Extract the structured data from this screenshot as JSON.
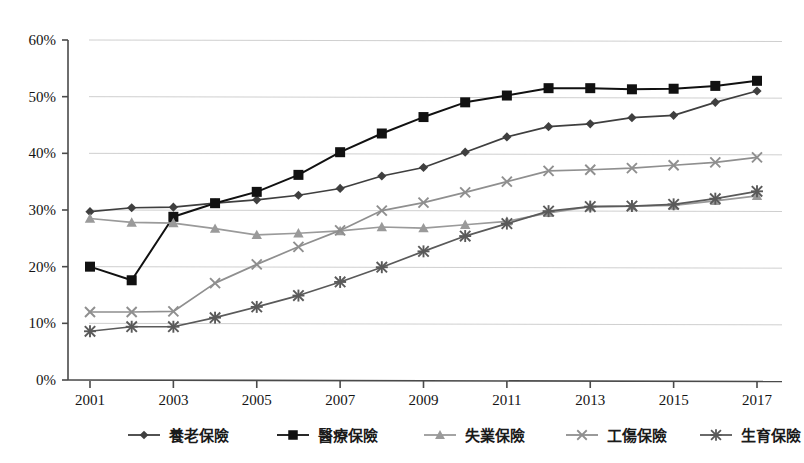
{
  "chart_data": {
    "type": "line",
    "title": "",
    "subtitle": "",
    "xlabel": "",
    "ylabel": "",
    "xlim": [
      2001,
      2017
    ],
    "ylim": [
      0,
      60
    ],
    "y_tick_format": "percent",
    "grid": true,
    "grid_axis": "y",
    "legend_position": "bottom",
    "x": [
      2001,
      2002,
      2003,
      2004,
      2005,
      2006,
      2007,
      2008,
      2009,
      2010,
      2011,
      2012,
      2013,
      2014,
      2015,
      2016,
      2017
    ],
    "x_tick_labels": [
      "2001",
      "2003",
      "2005",
      "2007",
      "2009",
      "2011",
      "2013",
      "2015",
      "2017"
    ],
    "x_tick_values": [
      2001,
      2003,
      2005,
      2007,
      2009,
      2011,
      2013,
      2015,
      2017
    ],
    "y_tick_labels": [
      "0%",
      "10%",
      "20%",
      "30%",
      "40%",
      "50%",
      "60%"
    ],
    "y_tick_values": [
      0,
      10,
      20,
      30,
      40,
      50,
      60
    ],
    "series": [
      {
        "name": "養老保險",
        "marker": "diamond",
        "color": "#3f3f3f",
        "values": [
          29.7,
          30.4,
          30.5,
          31.2,
          31.8,
          32.6,
          33.8,
          36.0,
          37.5,
          40.2,
          42.9,
          44.7,
          45.2,
          46.3,
          46.7,
          49.0,
          51.0
        ]
      },
      {
        "name": "醫療保險",
        "marker": "square",
        "color": "#111111",
        "values": [
          20.0,
          17.6,
          28.8,
          31.2,
          33.2,
          36.2,
          40.2,
          43.5,
          46.4,
          49.0,
          50.2,
          51.5,
          51.5,
          51.3,
          51.4,
          51.9,
          52.8
        ]
      },
      {
        "name": "失業保險",
        "marker": "triangle",
        "color": "#9a9a9a",
        "values": [
          28.5,
          27.8,
          27.7,
          26.7,
          25.6,
          25.9,
          26.3,
          27.0,
          26.8,
          27.4,
          28.0,
          29.5,
          30.6,
          30.7,
          30.8,
          31.6,
          32.5
        ]
      },
      {
        "name": "工傷保險",
        "marker": "cross",
        "color": "#8f8f8f",
        "values": [
          12.0,
          12.0,
          12.1,
          17.1,
          20.4,
          23.5,
          26.4,
          29.9,
          31.3,
          33.1,
          35.0,
          36.9,
          37.1,
          37.4,
          37.9,
          38.4,
          39.3
        ]
      },
      {
        "name": "生育保險",
        "marker": "star",
        "color": "#5a5a5a",
        "values": [
          8.6,
          9.4,
          9.4,
          11.0,
          12.9,
          14.9,
          17.3,
          19.9,
          22.7,
          25.4,
          27.6,
          29.8,
          30.6,
          30.7,
          31.0,
          32.0,
          33.3
        ]
      }
    ]
  },
  "legend": {
    "items": [
      {
        "label": "養老保險",
        "marker": "diamond",
        "color": "#3f3f3f"
      },
      {
        "label": "醫療保險",
        "marker": "square",
        "color": "#111111"
      },
      {
        "label": "失業保險",
        "marker": "triangle",
        "color": "#9a9a9a"
      },
      {
        "label": "工傷保險",
        "marker": "cross",
        "color": "#8f8f8f"
      },
      {
        "label": "生育保險",
        "marker": "star",
        "color": "#5a5a5a"
      }
    ]
  },
  "colors": {
    "background": "#ffffff",
    "grid": "#c9c9c9",
    "axis": "#4a4a4a",
    "text": "#141414"
  }
}
